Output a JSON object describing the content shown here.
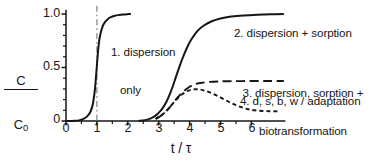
{
  "chart_data": {
    "type": "line",
    "title": "",
    "xlabel": "t / τ",
    "ylabel": "C / C₀",
    "ylabel_numerator": "C",
    "ylabel_denominator": "C",
    "ylabel_denominator_sub": "0",
    "xlim": [
      0,
      7.1
    ],
    "ylim": [
      0,
      1.04
    ],
    "grid": false,
    "legend": "inline-annotations",
    "x_ticks": [
      0,
      1,
      2,
      3,
      4,
      5,
      6
    ],
    "x_tick_labels": [
      "0",
      "1",
      "2",
      "3",
      "4",
      "5",
      "6"
    ],
    "x_minor_tick_interval": 0.5,
    "y_ticks": [
      0,
      0.5,
      1.0
    ],
    "y_tick_labels": [
      "0",
      "0.5",
      "1.0"
    ],
    "y_minor_tick_interval": 0.1,
    "reference_lines": [
      {
        "name": "tau-marker",
        "orientation": "vertical",
        "x": 1.0,
        "style": "dash-dot",
        "color": "#8a8a8a"
      }
    ],
    "series": [
      {
        "name": "dispersion only",
        "label": "1. dispersion\nonly",
        "label_line1": "1. dispersion",
        "label_line2": "only",
        "style": "solid",
        "color": "#161616",
        "x": [
          0.0,
          0.3,
          0.45,
          0.55,
          0.65,
          0.72,
          0.78,
          0.84,
          0.88,
          0.92,
          0.95,
          0.98,
          1.0,
          1.02,
          1.05,
          1.08,
          1.12,
          1.18,
          1.25,
          1.35,
          1.45,
          1.58,
          1.7,
          1.85,
          2.0,
          2.1
        ],
        "y": [
          0.0,
          0.002,
          0.008,
          0.018,
          0.035,
          0.055,
          0.08,
          0.125,
          0.175,
          0.255,
          0.34,
          0.445,
          0.52,
          0.595,
          0.69,
          0.76,
          0.82,
          0.88,
          0.92,
          0.952,
          0.97,
          0.983,
          0.99,
          0.996,
          0.999,
          1.0
        ]
      },
      {
        "name": "dispersion + sorption",
        "label": "2. dispersion + sorption",
        "style": "solid",
        "color": "#161616",
        "x": [
          2.35,
          2.55,
          2.7,
          2.85,
          2.95,
          3.05,
          3.15,
          3.25,
          3.35,
          3.45,
          3.55,
          3.65,
          3.75,
          3.9,
          4.05,
          4.25,
          4.45,
          4.7,
          5.0,
          5.35,
          5.75,
          6.2,
          6.65,
          7.05
        ],
        "y": [
          0.0,
          0.008,
          0.02,
          0.042,
          0.062,
          0.092,
          0.13,
          0.18,
          0.245,
          0.32,
          0.405,
          0.49,
          0.57,
          0.675,
          0.76,
          0.84,
          0.89,
          0.93,
          0.958,
          0.976,
          0.987,
          0.994,
          0.998,
          1.0
        ]
      },
      {
        "name": "dispersion, sorption + biotransformation",
        "label": "3. dispersion, sorption +\nbiotransformation",
        "label_line1": "3. dispersion, sorption +",
        "label_line2": "biotransformation",
        "style": "long-dash",
        "color": "#161616",
        "x": [
          2.9,
          3.05,
          3.2,
          3.35,
          3.5,
          3.62,
          3.75,
          3.9,
          4.05,
          4.2,
          4.4,
          4.65,
          4.95,
          5.3,
          5.7,
          6.15,
          6.6,
          7.05
        ],
        "y": [
          0.02,
          0.045,
          0.08,
          0.125,
          0.18,
          0.222,
          0.262,
          0.3,
          0.328,
          0.346,
          0.358,
          0.366,
          0.37,
          0.372,
          0.373,
          0.374,
          0.374,
          0.374
        ]
      },
      {
        "name": "d, s, b, w / adaptation",
        "label": "4. d, s, b, w / adaptation",
        "style": "short-dash",
        "color": "#161616",
        "x": [
          2.9,
          3.05,
          3.2,
          3.35,
          3.5,
          3.62,
          3.75,
          3.9,
          4.05,
          4.2,
          4.35,
          4.5,
          4.7,
          4.9,
          5.1,
          5.3,
          5.5,
          5.7,
          5.9,
          6.1,
          6.35,
          6.6,
          6.85
        ],
        "y": [
          0.02,
          0.045,
          0.08,
          0.125,
          0.178,
          0.215,
          0.248,
          0.275,
          0.292,
          0.297,
          0.294,
          0.283,
          0.262,
          0.235,
          0.205,
          0.175,
          0.148,
          0.126,
          0.11,
          0.1,
          0.094,
          0.091,
          0.09
        ]
      }
    ],
    "annotations": [
      {
        "name": "curve-1-label",
        "text_line1": "1. dispersion",
        "text_line2": "only"
      },
      {
        "name": "curve-2-label",
        "text": "2. dispersion + sorption"
      },
      {
        "name": "curve-3-label",
        "text_line1": "3. dispersion, sorption +",
        "text_line2": "biotransformation"
      },
      {
        "name": "curve-4-label",
        "text": "4. d, s, b, w / adaptation"
      }
    ]
  },
  "axis": {
    "x_labels": [
      "0",
      "1",
      "2",
      "3",
      "4",
      "5",
      "6"
    ],
    "y_labels": [
      "1.0",
      "0.5",
      "0"
    ],
    "x_title": "t / τ",
    "y_title_num": "C",
    "y_title_den": "C",
    "y_title_den_sub": "0"
  }
}
